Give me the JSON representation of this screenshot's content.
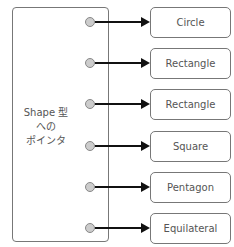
{
  "pointer_box": {
    "label_lines": [
      "Shape 型",
      "への",
      "ポインタ"
    ]
  },
  "targets": [
    {
      "label": "Circle"
    },
    {
      "label": "Rectangle"
    },
    {
      "label": "Rectangle"
    },
    {
      "label": "Square"
    },
    {
      "label": "Pentagon"
    },
    {
      "label": "Equilateral"
    }
  ],
  "colors": {
    "border": "#777777",
    "dot_fill": "#cccccc",
    "arrow": "#111111",
    "text": "#555555"
  }
}
